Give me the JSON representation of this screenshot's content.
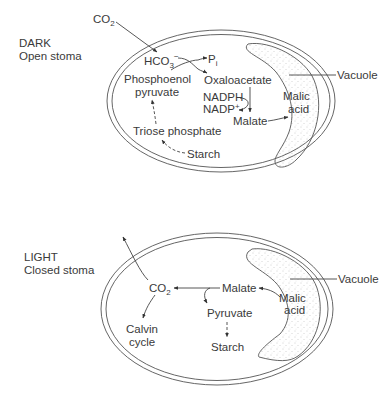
{
  "panels": [
    {
      "id": "dark",
      "condition": "DARK",
      "stoma": "Open stoma",
      "external": {
        "co2": "CO",
        "co2_sub": "2"
      },
      "metabolites": {
        "hco3": "HCO",
        "hco3_sub": "3",
        "hco3_sup": "−",
        "pi": "P",
        "pi_sub": "i",
        "pep_line1": "Phosphoenol",
        "pep_line2": "pyruvate",
        "oxaloacetate": "Oxaloacetate",
        "nadph": "NADPH",
        "nadp": "NADP",
        "nadp_sup": "+",
        "malate": "Malate",
        "triose": "Triose phosphate",
        "starch": "Starch"
      },
      "vacuole": {
        "label": "Vacuole",
        "content_line1": "Malic",
        "content_line2": "acid"
      }
    },
    {
      "id": "light",
      "condition": "LIGHT",
      "stoma": "Closed stoma",
      "metabolites": {
        "co2": "CO",
        "co2_sub": "2",
        "calvin_line1": "Calvin",
        "calvin_line2": "cycle",
        "malate": "Malate",
        "pyruvate": "Pyruvate",
        "starch": "Starch"
      },
      "vacuole": {
        "label": "Vacuole",
        "content_line1": "Malic",
        "content_line2": "acid"
      }
    }
  ],
  "colors": {
    "line": "#444444",
    "text": "#3a3a3a",
    "stipple": "#9a9a9a"
  }
}
